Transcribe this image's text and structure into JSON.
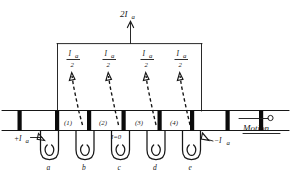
{
  "diagram": {
    "type": "engineering-schematic",
    "top_terminal": {
      "label": "2I",
      "subscript": "a",
      "arrow_direction": "up"
    },
    "branch_currents": [
      {
        "id": "branch-1",
        "numerator": "I",
        "numerator_sub": "a",
        "denominator": "2",
        "arrow_direction": "up"
      },
      {
        "id": "branch-2",
        "numerator": "I",
        "numerator_sub": "a",
        "denominator": "2",
        "arrow_direction": "up"
      },
      {
        "id": "branch-3",
        "numerator": "I",
        "numerator_sub": "a",
        "denominator": "2",
        "arrow_direction": "up"
      },
      {
        "id": "branch-4",
        "numerator": "I",
        "numerator_sub": "a",
        "denominator": "2",
        "arrow_direction": "up"
      }
    ],
    "coil_numbers": [
      "(1)",
      "(2)",
      "(3)",
      "(4)"
    ],
    "coil_letters": [
      "a",
      "b",
      "c",
      "d",
      "e"
    ],
    "input_current": {
      "label": "+I",
      "subscript": "a",
      "arrow_direction": "right-down"
    },
    "output_current": {
      "label": "−I",
      "subscript": "a",
      "arrow_direction": "left-down"
    },
    "zero_current": {
      "label": "I=0"
    },
    "motion": {
      "label": "Motion",
      "arrow_direction": "right"
    },
    "colors": {
      "ink": "#171717",
      "slot_fill": "#0b0b0b",
      "background": "#ffffff"
    },
    "slot_count": 8
  }
}
